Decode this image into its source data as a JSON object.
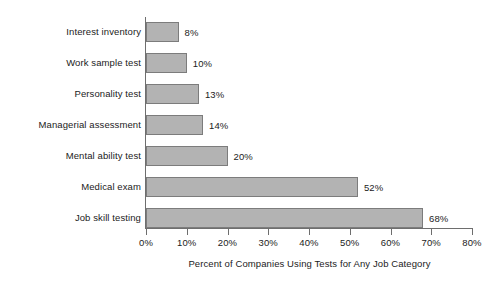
{
  "chart_data": {
    "type": "bar",
    "orientation": "horizontal",
    "title": "",
    "xlabel": "Percent of Companies Using Tests for Any Job Category",
    "ylabel": "",
    "categories": [
      "Interest inventory",
      "Work sample test",
      "Personality test",
      "Managerial assessment",
      "Mental ability test",
      "Medical exam",
      "Job skill testing"
    ],
    "values": [
      8,
      10,
      13,
      14,
      20,
      52,
      68
    ],
    "value_labels": [
      "8%",
      "10%",
      "13%",
      "14%",
      "20%",
      "52%",
      "68%"
    ],
    "xlim": [
      0,
      80
    ],
    "xticks": [
      0,
      10,
      20,
      30,
      40,
      50,
      60,
      70,
      80
    ],
    "xtick_labels": [
      "0%",
      "10%",
      "20%",
      "30%",
      "40%",
      "50%",
      "60%",
      "70%",
      "80%"
    ],
    "grid": false,
    "legend": null,
    "bar_fill_color": "#b3b3b3",
    "bar_border_color": "#7c7c7c",
    "axis_color": "#6e6e6e",
    "text_color": "#1b1b1b",
    "background_color": "#ffffff"
  }
}
